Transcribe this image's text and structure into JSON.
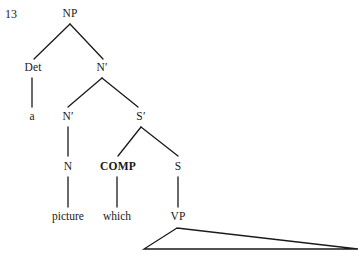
{
  "figure": {
    "example_number": "13",
    "background_color": "#ffffff",
    "ink_color": "#1a1a1a",
    "width": 360,
    "height": 260
  },
  "tree": {
    "nodes": [
      {
        "id": "np",
        "label": "NP",
        "x": 70,
        "y": 14,
        "bold": false,
        "kind": "category"
      },
      {
        "id": "det",
        "label": "Det",
        "x": 33,
        "y": 68,
        "bold": false,
        "kind": "category"
      },
      {
        "id": "nbar1",
        "label": "N′",
        "x": 102,
        "y": 68,
        "bold": false,
        "kind": "category"
      },
      {
        "id": "a",
        "label": "a",
        "x": 32,
        "y": 117,
        "bold": false,
        "kind": "terminal"
      },
      {
        "id": "nbar2",
        "label": "N′",
        "x": 68,
        "y": 117,
        "bold": false,
        "kind": "category"
      },
      {
        "id": "sbar",
        "label": "S′",
        "x": 141,
        "y": 117,
        "bold": false,
        "kind": "category"
      },
      {
        "id": "n",
        "label": "N",
        "x": 68,
        "y": 167,
        "bold": false,
        "kind": "category"
      },
      {
        "id": "comp",
        "label": "COMP",
        "x": 118,
        "y": 167,
        "bold": true,
        "kind": "category"
      },
      {
        "id": "s",
        "label": "S",
        "x": 178,
        "y": 167,
        "bold": false,
        "kind": "category"
      },
      {
        "id": "picture",
        "label": "picture",
        "x": 68,
        "y": 217,
        "bold": false,
        "kind": "terminal"
      },
      {
        "id": "which",
        "label": "which",
        "x": 117,
        "y": 217,
        "bold": false,
        "kind": "terminal"
      },
      {
        "id": "vp",
        "label": "VP",
        "x": 178,
        "y": 217,
        "bold": false,
        "kind": "category"
      }
    ],
    "branches": [
      {
        "from": "np",
        "to": "det",
        "x1": 70,
        "y1": 24,
        "x2": 34,
        "y2": 59
      },
      {
        "from": "np",
        "to": "nbar1",
        "x1": 70,
        "y1": 24,
        "x2": 103,
        "y2": 59
      },
      {
        "from": "det",
        "to": "a",
        "x1": 32,
        "y1": 78,
        "x2": 32,
        "y2": 107
      },
      {
        "from": "nbar1",
        "to": "nbar2",
        "x1": 102,
        "y1": 78,
        "x2": 68,
        "y2": 107
      },
      {
        "from": "nbar1",
        "to": "sbar",
        "x1": 102,
        "y1": 78,
        "x2": 138,
        "y2": 107
      },
      {
        "from": "nbar2",
        "to": "n",
        "x1": 68,
        "y1": 127,
        "x2": 68,
        "y2": 156
      },
      {
        "from": "sbar",
        "to": "comp",
        "x1": 141,
        "y1": 127,
        "x2": 118,
        "y2": 156
      },
      {
        "from": "sbar",
        "to": "s",
        "x1": 141,
        "y1": 127,
        "x2": 178,
        "y2": 156
      },
      {
        "from": "n",
        "to": "picture",
        "x1": 68,
        "y1": 177,
        "x2": 68,
        "y2": 207
      },
      {
        "from": "comp",
        "to": "which",
        "x1": 117,
        "y1": 177,
        "x2": 117,
        "y2": 207
      },
      {
        "from": "s",
        "to": "vp",
        "x1": 178,
        "y1": 177,
        "x2": 178,
        "y2": 207
      }
    ],
    "triangle": {
      "under": "vp",
      "apex_x": 177,
      "apex_y": 228,
      "left_x": 144,
      "left_y": 249,
      "right_x": 358,
      "right_y": 249
    }
  }
}
